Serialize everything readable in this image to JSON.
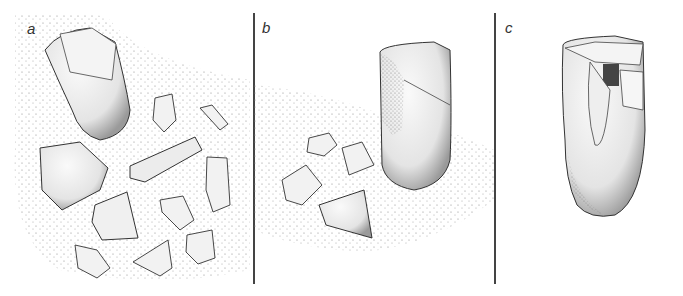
{
  "figure": {
    "panels": [
      {
        "id": "a",
        "label": "a",
        "description": "Large cylindrical core lying on its side surrounded by scattered flakes and debris"
      },
      {
        "id": "b",
        "label": "b",
        "description": "Upright cylindrical core with several detached flakes on the ground nearby"
      },
      {
        "id": "c",
        "label": "c",
        "description": "Refitted core with flake removal scars at top, isolated on white"
      }
    ],
    "colors": {
      "background": "#ffffff",
      "ink": "#333333",
      "divider": "#444444",
      "stipple": "#777777"
    }
  }
}
